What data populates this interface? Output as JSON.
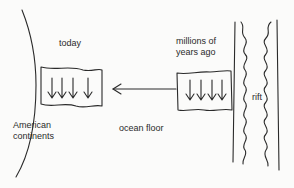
{
  "diagram": {
    "labels": {
      "today": "today",
      "millions_ago": "millions of\nyears ago",
      "continents": "American\ncontinents",
      "ocean_floor": "ocean floor",
      "rift": "rift"
    },
    "elements": {
      "continent_edge": "curved coastline of the American continents (left)",
      "today_block": "magnetic stripe block near continent with 4 downward arrows",
      "old_block": "magnetic stripe block near rift with 4 downward arrows",
      "motion_arrow": "arrow pointing left along the ocean floor",
      "rift_zone": "rift with two straight boundaries and two wavy inner edges"
    },
    "colors": {
      "ink": "#2a2a2a",
      "background": "#fbfbfa"
    }
  }
}
